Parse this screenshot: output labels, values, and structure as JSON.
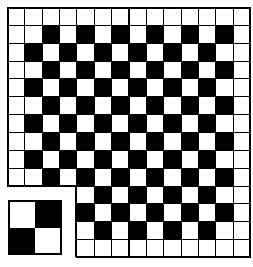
{
  "figure": {
    "colors": {
      "black": "#000000",
      "white": "#ffffff",
      "line": "#000000"
    }
  },
  "board": {
    "rows": 14,
    "cols": 14,
    "notch": {
      "row_start": 10,
      "row_end": 13,
      "col_start": 0,
      "col_end": 3
    },
    "cells": [
      "WWWWWWWWWWWWWW",
      "WWBWBWBWBWBWBW",
      "WBWBWBWBWBWBWW",
      "WWBWBWBWBWBWBW",
      "WBWBWBWBWBWBWW",
      "WWBWBWBWBWBWBW",
      "WBWBWBWBWBWBWW",
      "WWBWBWBWBWBWBW",
      "WBWBWBWBWBWBWW",
      "WWBWBWBWBWBWBW",
      "....WBWBWBWBWW",
      "....BWBWBWBWBW",
      "....WBWBWBWBWW",
      "....WWWWWWWWWW"
    ]
  },
  "tile": {
    "rows": 2,
    "cols": 2,
    "cells": [
      "WB",
      "BW"
    ]
  }
}
